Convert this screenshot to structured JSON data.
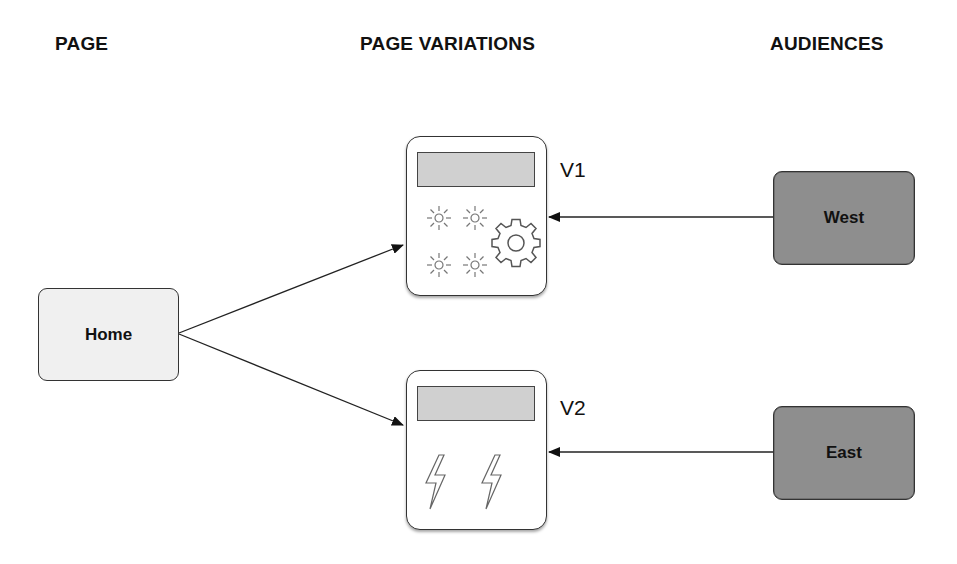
{
  "headers": {
    "page": "PAGE",
    "variations": "PAGE VARIATIONS",
    "audiences": "AUDIENCES"
  },
  "page_node": {
    "label": "Home",
    "fill": "#f0f0f0"
  },
  "variations": [
    {
      "label": "V1",
      "icons": [
        "sun-icon",
        "sun-icon",
        "sun-icon",
        "sun-icon",
        "gear-icon"
      ]
    },
    {
      "label": "V2",
      "icons": [
        "lightning-icon",
        "lightning-icon"
      ]
    }
  ],
  "audiences": [
    {
      "label": "West",
      "fill": "#8e8e8e",
      "targets": "V1"
    },
    {
      "label": "East",
      "fill": "#8e8e8e",
      "targets": "V2"
    }
  ],
  "edges": [
    {
      "from": "Home",
      "to": "V1"
    },
    {
      "from": "Home",
      "to": "V2"
    },
    {
      "from": "West",
      "to": "V1"
    },
    {
      "from": "East",
      "to": "V2"
    }
  ]
}
